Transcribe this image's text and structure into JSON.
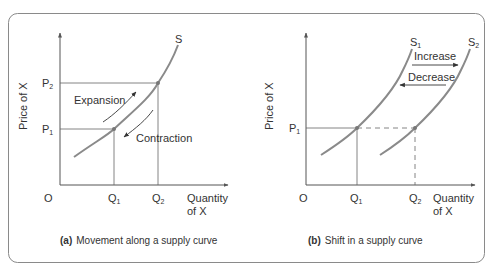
{
  "colors": {
    "frame": "#8a8a8a",
    "axis": "#555555",
    "curve": "#8a8a8a",
    "guide": "#666666",
    "text": "#333333",
    "point": "#777777"
  },
  "panel_a": {
    "curve_label": "S",
    "y_axis_label": "Price of X",
    "x_axis_label_line1": "Quantity",
    "x_axis_label_line2": "of X",
    "origin": "O",
    "p_high": "P",
    "p_high_sub": "2",
    "p_low": "P",
    "p_low_sub": "1",
    "q_low": "Q",
    "q_low_sub": "1",
    "q_high": "Q",
    "q_high_sub": "2",
    "annotation_up": "Expansion",
    "annotation_down": "Contraction",
    "caption_tag": "(a)",
    "caption": "Movement along a supply curve"
  },
  "panel_b": {
    "curve1_label": "S",
    "curve1_sub": "1",
    "curve2_label": "S",
    "curve2_sub": "2",
    "y_axis_label": "Price of X",
    "x_axis_label_line1": "Quantity",
    "x_axis_label_line2": "of X",
    "origin": "O",
    "p_level": "P",
    "p_level_sub": "1",
    "q_low": "Q",
    "q_low_sub": "1",
    "q_high": "Q",
    "q_high_sub": "2",
    "annotation_right": "Increase",
    "annotation_left": "Decrease",
    "caption_tag": "(b)",
    "caption": "Shift in a supply curve"
  }
}
